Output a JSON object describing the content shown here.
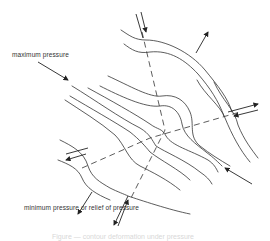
{
  "figure": {
    "labels": {
      "max_pressure": "maximum pressure",
      "min_pressure": "minimum pressure or relief of pressure"
    },
    "caption": "Figure — contour deformation under pressure",
    "colors": {
      "line": "#333333",
      "background": "#ffffff"
    }
  }
}
